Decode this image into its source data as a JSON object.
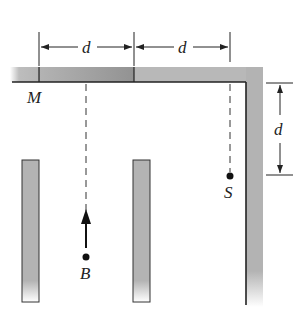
{
  "figure": {
    "labels": {
      "dim_top_left": "d",
      "dim_top_right": "d",
      "dim_right": "d",
      "point_m": "M",
      "point_s": "S",
      "point_b": "B"
    },
    "colors": {
      "wall_fill": "#b3b3b3",
      "wall_dark": "#8c8c8c",
      "line": "#222222",
      "background": "#ffffff"
    }
  }
}
